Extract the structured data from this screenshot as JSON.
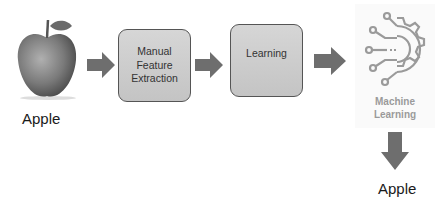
{
  "diagram": {
    "input": {
      "label": "Apple",
      "image": "apple-photo"
    },
    "steps": [
      {
        "label_lines": [
          "Manual",
          "Feature",
          "Extraction"
        ]
      },
      {
        "label_lines": [
          "Learning"
        ]
      }
    ],
    "model": {
      "icon": "machine-learning-gear-circuit-icon",
      "label_lines": [
        "Machine",
        "Learning"
      ]
    },
    "output": {
      "label": "Apple"
    },
    "colors": {
      "box_fill": "#cccccc",
      "box_border": "#555555",
      "arrow": "#6e6e6e",
      "icon": "#9a9a9a"
    }
  }
}
